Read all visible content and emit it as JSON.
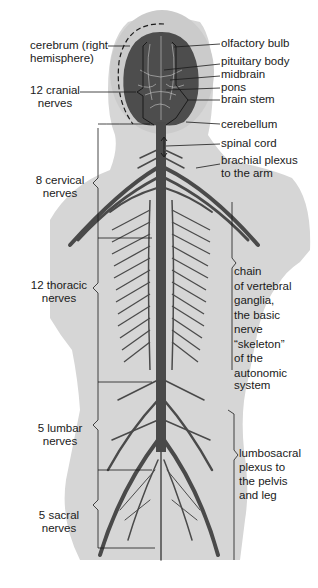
{
  "colors": {
    "background": "#ffffff",
    "body": "#d6d6d6",
    "head_light": "#c9c9c9",
    "nerve": "#4a4a4a",
    "brain": "#4d4d4d",
    "brain_lines": "#c8c8c8",
    "leader": "#1a1a1a",
    "text": "#1a1a1a"
  },
  "labels": {
    "left": {
      "cerebrum_1": "cerebrum (right",
      "cerebrum_2": "hemisphere)",
      "cranial_1": "12 cranial",
      "cranial_2": "nerves",
      "cervical_1": "8 cervical",
      "cervical_2": "nerves",
      "thoracic_1": "12 thoracic",
      "thoracic_2": "nerves",
      "lumbar_1": "5 lumbar",
      "lumbar_2": "nerves",
      "sacral_1": "5 sacral",
      "sacral_2": "nerves"
    },
    "right": {
      "olfactory": "olfactory bulb",
      "pituitary": "pituitary body",
      "midbrain": "midbrain",
      "pons": "pons",
      "brainstem": "brain stem",
      "cerebellum": "cerebellum",
      "spinal": "spinal cord",
      "brachial_1": "brachial plexus",
      "brachial_2": "to the arm",
      "chain": [
        "chain",
        "of vertebral",
        "ganglia,",
        "the basic",
        "nerve",
        "“skeleton”",
        "of the",
        "autonomic",
        "system"
      ],
      "lumbosacral": [
        "lumbosacral",
        "plexus to",
        "the pelvis",
        "and leg"
      ]
    }
  }
}
